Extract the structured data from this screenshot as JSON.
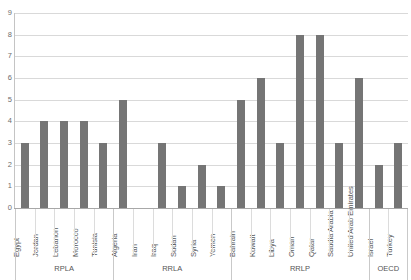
{
  "chart_data": {
    "type": "bar",
    "title": "",
    "xlabel": "",
    "ylabel": "",
    "ylim": [
      0,
      9
    ],
    "yticks": [
      "0",
      "1",
      "2",
      "3",
      "4",
      "5",
      "6",
      "7",
      "8",
      "9"
    ],
    "grid": true,
    "legend": false,
    "bar_color": "#757575",
    "categories": [
      "Egypt",
      "Jordan",
      "Lebanon",
      "Morocco",
      "Tunisia",
      "Algeria",
      "Iran",
      "Iraq",
      "Sudan",
      "Syria",
      "Yemen",
      "Bahrain",
      "Kuwait",
      "Libya",
      "Oman",
      "Qatar",
      "Saudia Arabia",
      "United Arab Emirates",
      "Israel",
      "Turkey"
    ],
    "values": [
      3,
      4,
      4,
      4,
      3,
      5,
      0,
      3,
      1,
      2,
      1,
      5,
      6,
      3,
      8,
      8,
      3,
      6,
      2,
      3
    ],
    "groups": [
      {
        "label": "RPLA",
        "start": 0,
        "end": 5
      },
      {
        "label": "RRLA",
        "start": 5,
        "end": 11
      },
      {
        "label": "RRLP",
        "start": 11,
        "end": 18
      },
      {
        "label": "OECD",
        "start": 18,
        "end": 20
      }
    ]
  }
}
